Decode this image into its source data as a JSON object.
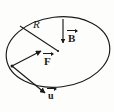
{
  "figure": {
    "type": "physics-vector-diagram",
    "background_color": "#fdfdfc",
    "ink_color": "#1a1a1a",
    "labels": {
      "radius": "R",
      "magnetic_field": "B",
      "force": "F",
      "velocity": "u"
    },
    "shapes": {
      "disk": {
        "name": "ellipse",
        "center_x": 58,
        "center_y": 52,
        "radius_x": 52,
        "radius_y": 35,
        "rotation_deg": -7
      }
    },
    "vectors": [
      {
        "name": "magnetic-field-vector",
        "label": "B",
        "from_x": 63,
        "from_y": 20,
        "to_x": 63,
        "to_y": 44,
        "direction": "down"
      },
      {
        "name": "force-vector",
        "label": "F",
        "from_x": 12,
        "from_y": 66,
        "to_x": 42,
        "to_y": 52,
        "direction": "up-right"
      },
      {
        "name": "velocity-vector",
        "label": "u",
        "from_x": 12,
        "from_y": 66,
        "to_x": 45,
        "to_y": 94,
        "direction": "down-right"
      }
    ],
    "radius_line": {
      "name": "radius-line",
      "from_x": 20,
      "from_y": 26,
      "to_x": 58,
      "to_y": 51
    }
  }
}
